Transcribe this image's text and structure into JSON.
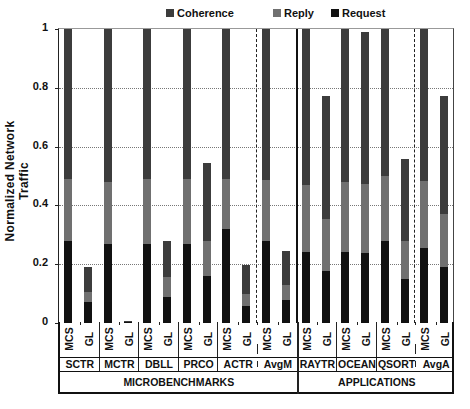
{
  "chart_data": {
    "type": "bar",
    "stacked": true,
    "title": "",
    "xlabel": "",
    "ylabel": "Normalized  Network Traffic",
    "ylim": [
      0,
      1
    ],
    "yticks": [
      "0",
      "0.2",
      "0.4",
      "0.6",
      "0.8",
      "1"
    ],
    "grid": true,
    "legend_position": "top",
    "legend": [
      {
        "name": "Coherence",
        "color": "#3c3c3c"
      },
      {
        "name": "Reply",
        "color": "#707070"
      },
      {
        "name": "Request",
        "color": "#111111"
      }
    ],
    "groups": [
      {
        "label": "SCTR",
        "category": "MICROBENCHMARKS",
        "bars": [
          {
            "label": "MCS",
            "request": 0.28,
            "reply": 0.21,
            "coherence": 0.51
          },
          {
            "label": "GL",
            "request": 0.07,
            "reply": 0.035,
            "coherence": 0.085
          }
        ]
      },
      {
        "label": "MCTR",
        "category": "MICROBENCHMARKS",
        "bars": [
          {
            "label": "MCS",
            "request": 0.27,
            "reply": 0.21,
            "coherence": 0.52
          },
          {
            "label": "GL",
            "request": 0.003,
            "reply": 0.001,
            "coherence": 0.001
          }
        ]
      },
      {
        "label": "DBLL",
        "category": "MICROBENCHMARKS",
        "bars": [
          {
            "label": "MCS",
            "request": 0.27,
            "reply": 0.22,
            "coherence": 0.51
          },
          {
            "label": "GL",
            "request": 0.09,
            "reply": 0.065,
            "coherence": 0.125
          }
        ]
      },
      {
        "label": "PRCO",
        "category": "MICROBENCHMARKS",
        "bars": [
          {
            "label": "MCS",
            "request": 0.27,
            "reply": 0.22,
            "coherence": 0.51
          },
          {
            "label": "GL",
            "request": 0.16,
            "reply": 0.12,
            "coherence": 0.265
          }
        ]
      },
      {
        "label": "ACTR",
        "category": "MICROBENCHMARKS",
        "bars": [
          {
            "label": "MCS",
            "request": 0.32,
            "reply": 0.17,
            "coherence": 0.51
          },
          {
            "label": "GL",
            "request": 0.058,
            "reply": 0.042,
            "coherence": 0.097
          }
        ]
      },
      {
        "label": "AvgM",
        "category": "MICROBENCHMARKS",
        "bars": [
          {
            "label": "MCS",
            "request": 0.28,
            "reply": 0.205,
            "coherence": 0.515
          },
          {
            "label": "GL",
            "request": 0.077,
            "reply": 0.053,
            "coherence": 0.114
          }
        ]
      },
      {
        "label": "RAYTR",
        "category": "APPLICATIONS",
        "bars": [
          {
            "label": "MCS",
            "request": 0.24,
            "reply": 0.23,
            "coherence": 0.53
          },
          {
            "label": "GL",
            "request": 0.177,
            "reply": 0.178,
            "coherence": 0.418
          }
        ]
      },
      {
        "label": "OCEAN",
        "category": "APPLICATIONS",
        "bars": [
          {
            "label": "MCS",
            "request": 0.24,
            "reply": 0.24,
            "coherence": 0.52
          },
          {
            "label": "GL",
            "request": 0.238,
            "reply": 0.236,
            "coherence": 0.516
          }
        ]
      },
      {
        "label": "QSORT",
        "category": "APPLICATIONS",
        "bars": [
          {
            "label": "MCS",
            "request": 0.28,
            "reply": 0.22,
            "coherence": 0.5
          },
          {
            "label": "GL",
            "request": 0.15,
            "reply": 0.13,
            "coherence": 0.277
          }
        ]
      },
      {
        "label": "AvgA",
        "category": "APPLICATIONS",
        "bars": [
          {
            "label": "MCS",
            "request": 0.254,
            "reply": 0.229,
            "coherence": 0.517
          },
          {
            "label": "GL",
            "request": 0.19,
            "reply": 0.18,
            "coherence": 0.403
          }
        ]
      }
    ],
    "categories": [
      {
        "label": "MICROBENCHMARKS",
        "span": 6
      },
      {
        "label": "APPLICATIONS",
        "span": 4
      }
    ],
    "dashed_separators_before": [
      "AvgM",
      "AvgA"
    ]
  }
}
